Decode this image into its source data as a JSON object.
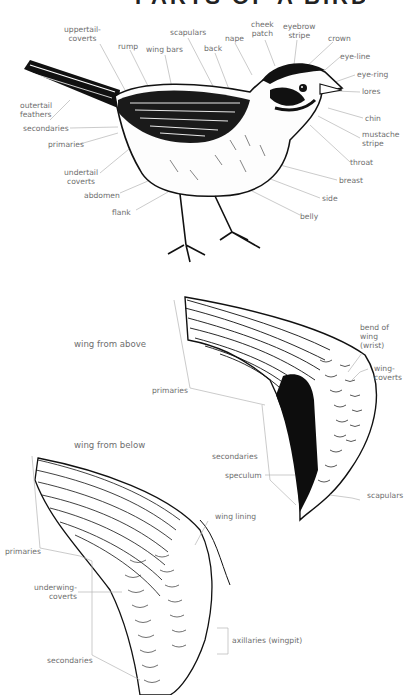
{
  "title": "PARTS OF A BIRD",
  "bird_labels": {
    "uppertail_coverts": "uppertail-\ncoverts",
    "rump": "rump",
    "wing_bars": "wing bars",
    "scapulars": "scapulars",
    "back": "back",
    "nape": "nape",
    "cheek_patch": "cheek\npatch",
    "eyebrow_stripe": "eyebrow\nstripe",
    "crown": "crown",
    "eye_line": "eye-line",
    "eye_ring": "eye-ring",
    "lores": "lores",
    "chin": "chin",
    "mustache_stripe": "mustache\nstripe",
    "throat": "throat",
    "breast": "breast",
    "side": "side",
    "belly": "belly",
    "outertail_feathers": "outertail\nfeathers",
    "secondaries": "secondaries",
    "primaries": "primaries",
    "undertail_coverts": "undertail\ncoverts",
    "abdomen": "abdomen",
    "flank": "flank"
  },
  "wing_above": {
    "heading": "wing from above",
    "bend_of_wing": "bend of\nwing\n(wrist)",
    "wing_coverts": "wing-\ncoverts",
    "primaries": "primaries",
    "secondaries": "secondaries",
    "speculum": "speculum",
    "scapulars": "scapulars"
  },
  "wing_below": {
    "heading": "wing from below",
    "wing_lining": "wing lining",
    "primaries": "primaries",
    "underwing_coverts": "underwing-\ncoverts",
    "axillaries": "axillaries (wingpit)",
    "secondaries": "secondaries"
  },
  "colors": {
    "label_text": "#6e6e6e",
    "leader_line": "#b5b5b5",
    "ink": "#111111",
    "background": "#ffffff"
  }
}
